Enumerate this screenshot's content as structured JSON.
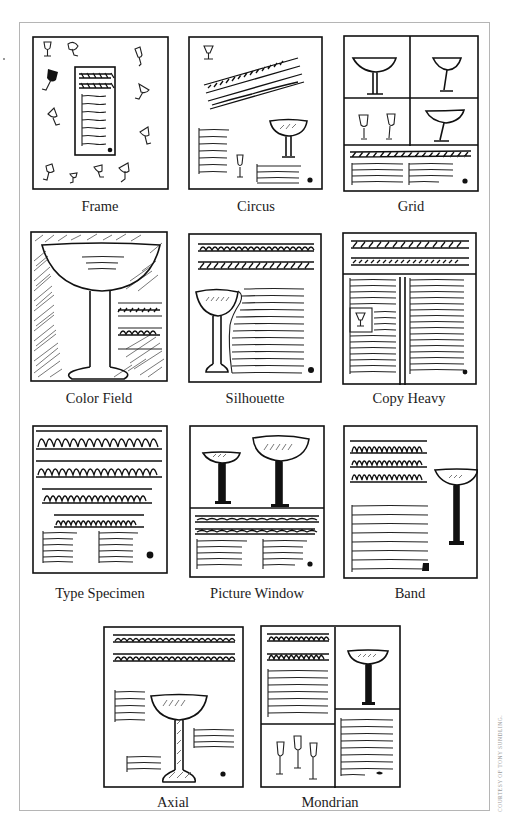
{
  "figure": {
    "credit": "COURTESY OF TONY SUNDLING.",
    "ink_color": "#111111",
    "frame_color": "#b5b5b5",
    "layouts": [
      {
        "id": "frame",
        "label": "Frame",
        "row": 1,
        "col": 1
      },
      {
        "id": "circus",
        "label": "Circus",
        "row": 1,
        "col": 2
      },
      {
        "id": "grid",
        "label": "Grid",
        "row": 1,
        "col": 3
      },
      {
        "id": "color-field",
        "label": "Color Field",
        "row": 2,
        "col": 1
      },
      {
        "id": "silhouette",
        "label": "Silhouette",
        "row": 2,
        "col": 2
      },
      {
        "id": "copy-heavy",
        "label": "Copy Heavy",
        "row": 2,
        "col": 3
      },
      {
        "id": "type-specimen",
        "label": "Type Specimen",
        "row": 3,
        "col": 1
      },
      {
        "id": "picture-window",
        "label": "Picture Window",
        "row": 3,
        "col": 2
      },
      {
        "id": "band",
        "label": "Band",
        "row": 3,
        "col": 3
      },
      {
        "id": "axial",
        "label": "Axial",
        "row": 4,
        "col": 1
      },
      {
        "id": "mondrian",
        "label": "Mondrian",
        "row": 4,
        "col": 2
      }
    ]
  }
}
